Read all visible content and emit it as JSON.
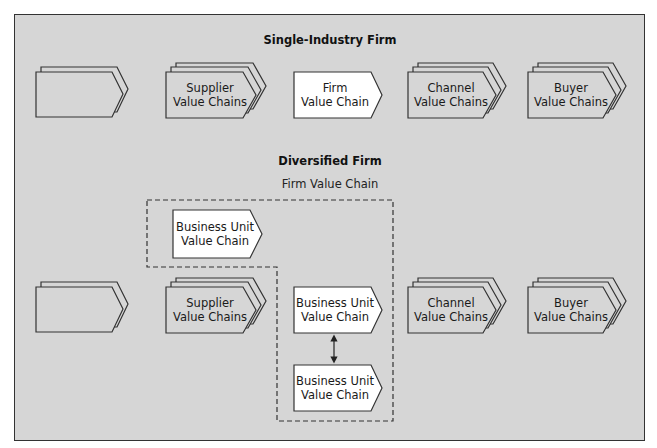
{
  "colors": {
    "background": "#d6d6d6",
    "stroke": "#333333",
    "white_fill": "#ffffff",
    "dashed": "#333333"
  },
  "single_industry": {
    "title": "Single-Industry Firm",
    "shapes": [
      {
        "label": "",
        "layers": 2,
        "fill": "gray"
      },
      {
        "label": "Supplier\nValue Chains",
        "layers": 3,
        "fill": "gray"
      },
      {
        "label": "Firm\nValue Chain",
        "layers": 1,
        "fill": "white"
      },
      {
        "label": "Channel\nValue Chains",
        "layers": 3,
        "fill": "gray"
      },
      {
        "label": "Buyer\nValue Chains",
        "layers": 3,
        "fill": "gray"
      }
    ]
  },
  "diversified": {
    "title": "Diversified Firm",
    "firm_value_chain_label": "Firm Value Chain",
    "shapes": [
      {
        "label": "",
        "layers": 2,
        "fill": "gray"
      },
      {
        "label": "Supplier\nValue Chains",
        "layers": 3,
        "fill": "gray"
      },
      {
        "label": "Business Unit\nValue Chain",
        "layers": 1,
        "fill": "white"
      },
      {
        "label": "Business Unit\nValue Chain",
        "layers": 1,
        "fill": "white"
      },
      {
        "label": "Business Unit\nValue Chain",
        "layers": 1,
        "fill": "white"
      },
      {
        "label": "Channel\nValue Chains",
        "layers": 3,
        "fill": "gray"
      },
      {
        "label": "Buyer\nValue Chains",
        "layers": 3,
        "fill": "gray"
      }
    ],
    "connector": "bidirectional-arrow"
  }
}
